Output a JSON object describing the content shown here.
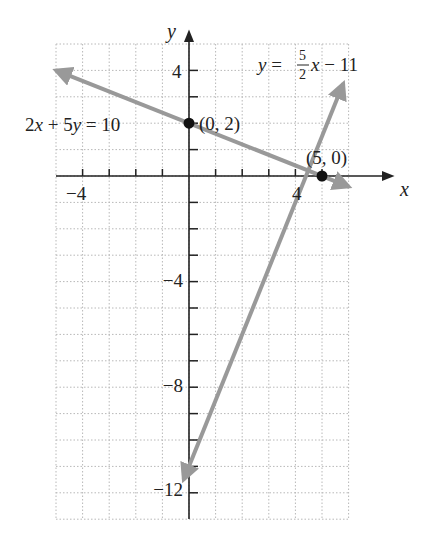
{
  "chart_data": {
    "type": "line",
    "title": "",
    "xlabel": "x",
    "ylabel": "y",
    "xlim": [
      -5,
      6
    ],
    "ylim": [
      -13,
      5
    ],
    "grid": true,
    "grid_style": "dotted",
    "x_tick_labels": [
      {
        "value": -4,
        "label": "−4"
      },
      {
        "value": 4,
        "label": "4"
      }
    ],
    "y_tick_labels": [
      {
        "value": 4,
        "label": "4"
      },
      {
        "value": -4,
        "label": "−4"
      },
      {
        "value": -8,
        "label": "−8"
      },
      {
        "value": -12,
        "label": "−12"
      }
    ],
    "series": [
      {
        "name": "2x + 5y = 10",
        "equation": "2x + 5y = 10",
        "slope": -0.4,
        "intercept": 2,
        "x": [
          -5,
          6
        ],
        "y": [
          4,
          -0.4
        ],
        "color": "#999999"
      },
      {
        "name": "y = 5/2 x − 11",
        "equation": "y = (5/2)x − 11",
        "slope": 2.5,
        "intercept": -11,
        "x": [
          -0.2,
          5.8
        ],
        "y": [
          -11.5,
          3.5
        ],
        "color": "#999999"
      }
    ],
    "points": [
      {
        "x": 0,
        "y": 2,
        "label": "(0, 2)"
      },
      {
        "x": 5,
        "y": 0,
        "label": "(5, 0)"
      }
    ],
    "annotations": [
      {
        "text": "2x + 5y = 10",
        "near": [
          -5,
          2
        ]
      },
      {
        "text": "y = 5/2 x − 11",
        "near": [
          3.5,
          4
        ]
      }
    ]
  },
  "labels": {
    "x_axis": "x",
    "y_axis": "y",
    "x_tick_neg4": "−4",
    "x_tick_4": "4",
    "y_tick_4": "4",
    "y_tick_neg4": "−4",
    "y_tick_neg8": "−8",
    "y_tick_neg12": "−12",
    "point_a": "(0, 2)",
    "point_b": "(5, 0)",
    "eq1_part1": "2",
    "eq1_x": "x",
    "eq1_part2": " + 5",
    "eq1_y": "y",
    "eq1_part3": " = 10",
    "eq2_y": "y",
    "eq2_eq": " = ",
    "eq2_num": "5",
    "eq2_den": "2",
    "eq2_x": "x",
    "eq2_rest": " − 11"
  }
}
